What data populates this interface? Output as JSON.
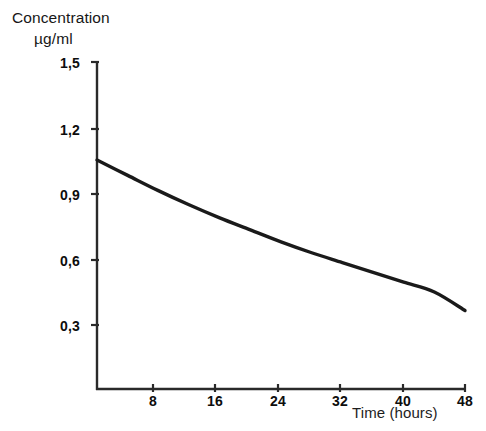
{
  "chart_data": {
    "type": "line",
    "title": "",
    "ylabel_line1": "Concentration",
    "ylabel_line2": "µg/ml",
    "xlabel": "Time (hours)",
    "x": [
      0,
      4,
      8,
      12,
      16,
      20,
      24,
      28,
      32,
      36,
      40,
      44,
      48
    ],
    "y": [
      1.05,
      0.98,
      0.91,
      0.845,
      0.785,
      0.73,
      0.675,
      0.625,
      0.58,
      0.535,
      0.49,
      0.445,
      0.36
    ],
    "series": [
      {
        "name": "Concentration",
        "values": [
          1.05,
          0.98,
          0.91,
          0.845,
          0.785,
          0.73,
          0.675,
          0.625,
          0.58,
          0.535,
          0.49,
          0.445,
          0.36
        ],
        "color": "#1a1a1a"
      }
    ],
    "xlim": [
      0,
      48
    ],
    "ylim": [
      0,
      1.5
    ],
    "xticks": [
      8,
      16,
      24,
      32,
      40,
      48
    ],
    "xtick_labels": [
      "8",
      "16",
      "24",
      "32",
      "40",
      "48"
    ],
    "yticks": [
      0.3,
      0.6,
      0.9,
      1.2,
      1.5
    ],
    "ytick_labels": [
      "0,3",
      "0,6",
      "0,9",
      "1,2",
      "1,5"
    ],
    "grid": false,
    "legend": false,
    "legend_position": "none",
    "axis_color": "#222222",
    "curve_color": "#1a1a1a",
    "background_color": "#ffffff"
  }
}
